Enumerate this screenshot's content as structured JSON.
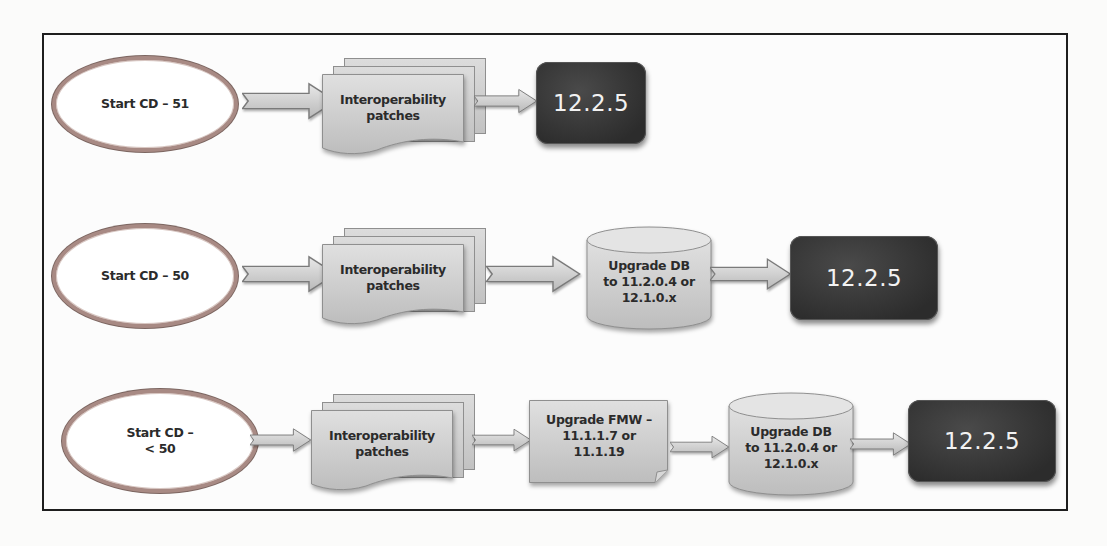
{
  "diagram": {
    "type": "upgrade-path-flowchart",
    "rows": [
      {
        "start": "Start CD – 51",
        "steps": [
          {
            "shape": "multi-document",
            "label_line1": "Interoperability",
            "label_line2": "patches"
          }
        ],
        "target": "12.2.5"
      },
      {
        "start": "Start CD – 50",
        "steps": [
          {
            "shape": "multi-document",
            "label_line1": "Interoperability",
            "label_line2": "patches"
          },
          {
            "shape": "cylinder",
            "label_line1": "Upgrade DB",
            "label_line2": "to 11.2.0.4 or",
            "label_line3": "12.1.0.x"
          }
        ],
        "target": "12.2.5"
      },
      {
        "start_line1": "Start CD –",
        "start_line2": "< 50",
        "steps": [
          {
            "shape": "multi-document",
            "label_line1": "Interoperability",
            "label_line2": "patches"
          },
          {
            "shape": "document",
            "label_line1": "Upgrade FMW –",
            "label_line2": "11.1.1.7 or",
            "label_line3": "11.1.19"
          },
          {
            "shape": "cylinder",
            "label_line1": "Upgrade DB",
            "label_line2": "to 11.2.0.4 or",
            "label_line3": "12.1.0.x"
          }
        ],
        "target": "12.2.5"
      }
    ],
    "colors": {
      "ellipse_border": "#a88a84",
      "step_fill": "#cfcfcf",
      "target_fill": "#333333",
      "target_text": "#f2f2f2",
      "frame_border": "#1e1e1e"
    }
  }
}
